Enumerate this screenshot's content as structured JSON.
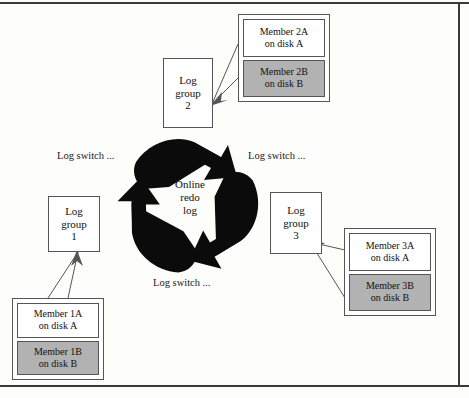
{
  "diagram": {
    "center": {
      "name": "online-redo-log",
      "lines": [
        "Online",
        "redo",
        "log"
      ]
    },
    "switch_labels": [
      {
        "id": "log-switch-left",
        "text": "Log switch ..."
      },
      {
        "id": "log-switch-right",
        "text": "Log switch ..."
      },
      {
        "id": "log-switch-bottom",
        "text": "Log switch ..."
      }
    ],
    "groups": [
      {
        "id": "log-group-1",
        "lines": [
          "Log",
          "group",
          "1"
        ],
        "members": [
          {
            "id": "member-1a",
            "lines": [
              "Member 1A",
              "on disk A"
            ],
            "shaded": false
          },
          {
            "id": "member-1b",
            "lines": [
              "Member 1B",
              "on disk B"
            ],
            "shaded": true
          }
        ]
      },
      {
        "id": "log-group-2",
        "lines": [
          "Log",
          "group",
          "2"
        ],
        "members": [
          {
            "id": "member-2a",
            "lines": [
              "Member 2A",
              "on disk A"
            ],
            "shaded": false
          },
          {
            "id": "member-2b",
            "lines": [
              "Member 2B",
              "on disk B"
            ],
            "shaded": true
          }
        ]
      },
      {
        "id": "log-group-3",
        "lines": [
          "Log",
          "group",
          "3"
        ],
        "members": [
          {
            "id": "member-3a",
            "lines": [
              "Member 3A",
              "on disk A"
            ],
            "shaded": false
          },
          {
            "id": "member-3b",
            "lines": [
              "Member 3B",
              "on disk B"
            ],
            "shaded": true
          }
        ]
      }
    ],
    "colors": {
      "shaded_fill": "#b2b2b2",
      "plain_fill": "#ffffff",
      "stroke": "#555555",
      "recycle_fill": "#0b0b0b",
      "text": "#111111"
    }
  }
}
